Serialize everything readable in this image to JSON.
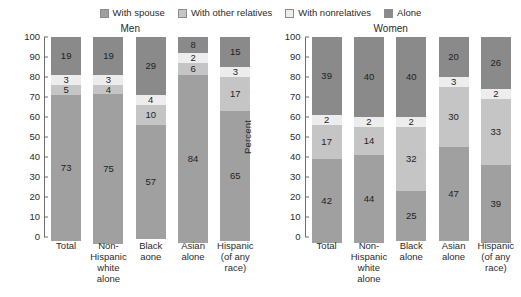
{
  "legend": {
    "items": [
      {
        "label": "With spouse",
        "color": "#a0a0a0",
        "key": "spouse"
      },
      {
        "label": "With other relatives",
        "color": "#c5c5c5",
        "key": "other_relatives"
      },
      {
        "label": "With nonrelatives",
        "color": "#ededed",
        "key": "nonrelatives"
      },
      {
        "label": "Alone",
        "color": "#8a8a8a",
        "key": "alone"
      }
    ]
  },
  "chart_data": [
    {
      "type": "bar",
      "title": "Men",
      "xlabel": "",
      "ylabel": "Percent",
      "ylim": [
        0,
        100
      ],
      "ytick_step": 10,
      "yticks": [
        100,
        90,
        80,
        70,
        60,
        50,
        40,
        30,
        20,
        10,
        0
      ],
      "grid": false,
      "stacked": true,
      "legend_position": "top-center",
      "categories": [
        [
          "Total"
        ],
        [
          "Non-",
          "Hispanic",
          "white",
          "alone"
        ],
        [
          "Black",
          "aone"
        ],
        [
          "Asian",
          "alone"
        ],
        [
          "Hispanic",
          "(of any",
          "race)"
        ]
      ],
      "series": [
        {
          "name": "With spouse",
          "values": [
            73,
            75,
            57,
            84,
            65
          ]
        },
        {
          "name": "With other relatives",
          "values": [
            5,
            4,
            10,
            6,
            17
          ]
        },
        {
          "name": "With nonrelatives",
          "values": [
            3,
            3,
            4,
            2,
            3
          ]
        },
        {
          "name": "Alone",
          "values": [
            19,
            19,
            29,
            8,
            15
          ]
        }
      ]
    },
    {
      "type": "bar",
      "title": "Women",
      "xlabel": "",
      "ylabel": "Percent",
      "ylim": [
        0,
        100
      ],
      "ytick_step": 10,
      "yticks": [
        100,
        90,
        80,
        70,
        60,
        50,
        40,
        30,
        20,
        10,
        0
      ],
      "grid": false,
      "stacked": true,
      "legend_position": "top-center",
      "categories": [
        [
          "Total"
        ],
        [
          "Non-",
          "Hispanic",
          "white",
          "alone"
        ],
        [
          "Black",
          "alone"
        ],
        [
          "Asian",
          "alone"
        ],
        [
          "Hispanic",
          "(of any",
          "race)"
        ]
      ],
      "series": [
        {
          "name": "With spouse",
          "values": [
            42,
            44,
            25,
            47,
            39
          ]
        },
        {
          "name": "With other relatives",
          "values": [
            17,
            14,
            32,
            30,
            33
          ]
        },
        {
          "name": "With nonrelatives",
          "values": [
            2,
            2,
            2,
            3,
            2
          ]
        },
        {
          "name": "Alone",
          "values": [
            39,
            40,
            40,
            20,
            26
          ]
        }
      ]
    }
  ]
}
